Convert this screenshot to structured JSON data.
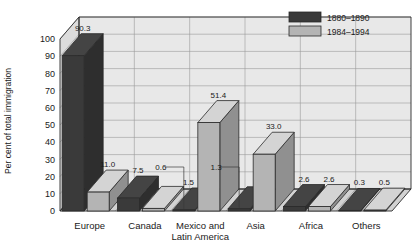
{
  "chart_data": {
    "type": "bar",
    "title": "",
    "xlabel": "",
    "ylabel": "Per cent of total immigration",
    "ylim": [
      0,
      100
    ],
    "ytick_labels": [
      "0",
      "10",
      "20",
      "30",
      "40",
      "50",
      "60",
      "70",
      "80",
      "90",
      "100"
    ],
    "grid": true,
    "legend_position": "top-right",
    "categories": [
      "Europe",
      "Canada",
      "Mexico and Latin America",
      "Asia",
      "Africa",
      "Others"
    ],
    "category_lines": [
      [
        "Europe"
      ],
      [
        "Canada"
      ],
      [
        "Mexico and",
        "Latin America"
      ],
      [
        "Asia"
      ],
      [
        "Africa"
      ],
      [
        "Others"
      ]
    ],
    "series": [
      {
        "name": "1880–1890",
        "color": "#3a3a3a",
        "values": [
          90.3,
          7.5,
          0.6,
          1.3,
          2.6,
          0.3
        ],
        "value_labels": [
          "90.3",
          "7.5",
          "0.6",
          "1.3",
          "2.6",
          "0.3"
        ]
      },
      {
        "name": "1984–1994",
        "color": "#b4b4b4",
        "values": [
          11.0,
          1.5,
          51.4,
          33.0,
          2.6,
          0.5
        ],
        "value_labels": [
          "11.0",
          "1.5",
          "51.4",
          "33.0",
          "2.6",
          "0.5"
        ]
      }
    ]
  },
  "legend": {
    "entries": [
      {
        "label": "1880–1890",
        "color": "#3a3a3a"
      },
      {
        "label": "1984–1994",
        "color": "#b4b4b4"
      }
    ]
  },
  "axes": {
    "y_title": "Per cent of total immigration",
    "y_ticks": [
      "100",
      "90",
      "80",
      "70",
      "60",
      "50",
      "40",
      "30",
      "20",
      "10",
      "0"
    ]
  },
  "colors": {
    "series_1880": "#3a3a3a",
    "series_1984": "#b4b4b4",
    "plot_background": "#e8e8e8",
    "floor": "#d2d2d2",
    "gridline": "#9a9a9a",
    "outline": "#2a2a2a"
  }
}
